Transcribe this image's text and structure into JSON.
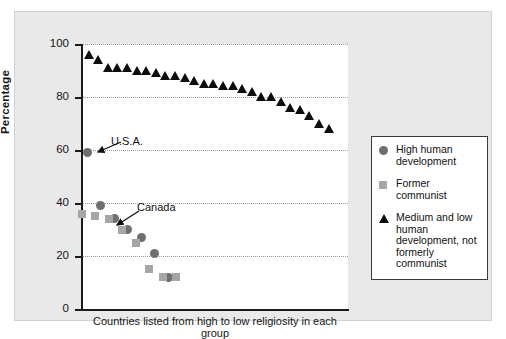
{
  "chart_data": {
    "type": "scatter",
    "title": "",
    "xlabel": "Countries listed from high to low religiosity in each group",
    "ylabel": "Percentage",
    "ylim": [
      0,
      100
    ],
    "yticks": [
      0,
      20,
      40,
      60,
      80,
      100
    ],
    "ytick_labels": [
      "0",
      "20",
      "40",
      "60",
      "80",
      "100"
    ],
    "grid": "horizontal-dotted",
    "legend_position": "right",
    "series": [
      {
        "name": "High human development",
        "marker": "circle",
        "color": "#6f6f6f",
        "points": [
          {
            "x": 1,
            "y": 59
          },
          {
            "x": 2,
            "y": 39
          },
          {
            "x": 3,
            "y": 34
          },
          {
            "x": 4,
            "y": 30
          },
          {
            "x": 5,
            "y": 27
          },
          {
            "x": 6,
            "y": 21
          },
          {
            "x": 7,
            "y": 12
          }
        ]
      },
      {
        "name": "Former communist",
        "marker": "square",
        "color": "#a6a6a6",
        "points": [
          {
            "x": 1,
            "y": 36
          },
          {
            "x": 2,
            "y": 35
          },
          {
            "x": 3,
            "y": 34
          },
          {
            "x": 4,
            "y": 30
          },
          {
            "x": 5,
            "y": 25
          },
          {
            "x": 6,
            "y": 15
          },
          {
            "x": 7,
            "y": 12
          },
          {
            "x": 8,
            "y": 12
          }
        ]
      },
      {
        "name": "Medium and low human development, not formerly communist",
        "marker": "triangle",
        "color": "#0d0d0d",
        "points": [
          {
            "x": 1,
            "y": 96
          },
          {
            "x": 2,
            "y": 94
          },
          {
            "x": 3,
            "y": 91
          },
          {
            "x": 4,
            "y": 91
          },
          {
            "x": 5,
            "y": 91
          },
          {
            "x": 6,
            "y": 90
          },
          {
            "x": 7,
            "y": 90
          },
          {
            "x": 8,
            "y": 89
          },
          {
            "x": 9,
            "y": 88
          },
          {
            "x": 10,
            "y": 88
          },
          {
            "x": 11,
            "y": 87
          },
          {
            "x": 12,
            "y": 86
          },
          {
            "x": 13,
            "y": 85
          },
          {
            "x": 14,
            "y": 85
          },
          {
            "x": 15,
            "y": 84
          },
          {
            "x": 16,
            "y": 84
          },
          {
            "x": 17,
            "y": 83
          },
          {
            "x": 18,
            "y": 82
          },
          {
            "x": 19,
            "y": 80
          },
          {
            "x": 20,
            "y": 80
          },
          {
            "x": 21,
            "y": 78
          },
          {
            "x": 22,
            "y": 76
          },
          {
            "x": 23,
            "y": 75
          },
          {
            "x": 24,
            "y": 73
          },
          {
            "x": 25,
            "y": 70
          },
          {
            "x": 26,
            "y": 68
          }
        ]
      }
    ],
    "annotations": [
      {
        "label": "U.S.A.",
        "target_series": "High human development",
        "target_x": 1,
        "target_y": 59
      },
      {
        "label": "Canada",
        "target_series": "High human development",
        "target_x": 3,
        "target_y": 34
      }
    ]
  },
  "legend": {
    "items": [
      {
        "key": "circle-marker",
        "label": "High human development"
      },
      {
        "key": "square-marker",
        "label": "Former communist"
      },
      {
        "key": "triangle-marker",
        "label": "Medium and low human development, not formerly communist"
      }
    ]
  },
  "axes": {
    "y_label": "Percentage",
    "x_label": "Countries listed from high to low religiosity in each group",
    "y_ticks": [
      "100",
      "80",
      "60",
      "40",
      "20",
      "0"
    ]
  },
  "annotations": {
    "usa": "U.S.A.",
    "canada": "Canada"
  },
  "colors": {
    "panel_background": "#e9e9e9",
    "plot_background": "#ffffff",
    "axis": "#1a1a1a",
    "grid": "#9a9a9a",
    "circle_series": "#6f6f6f",
    "square_series": "#a6a6a6",
    "triangle_series": "#0d0d0d",
    "legend_border": "#3b3b3b"
  }
}
